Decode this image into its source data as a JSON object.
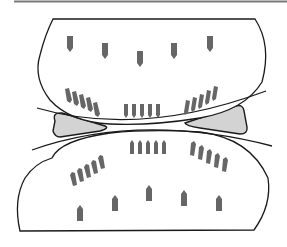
{
  "diagram": {
    "colors": {
      "background": "#ffffff",
      "outline": "#1a1a1a",
      "top_rule": "#7a7a7a",
      "wedge_fill": "#d3d3d3",
      "marker_fill": "#666666"
    },
    "top_body": {
      "outer_markers_count": 5,
      "inner_marker_groups": [
        {
          "position": "left",
          "count": 5
        },
        {
          "position": "center",
          "count": 5
        },
        {
          "position": "right",
          "count": 5
        }
      ],
      "marker_direction": "down"
    },
    "bottom_body": {
      "outer_markers_count": 5,
      "inner_marker_groups": [
        {
          "position": "left",
          "count": 5
        },
        {
          "position": "center",
          "count": 5
        },
        {
          "position": "right",
          "count": 5
        }
      ],
      "marker_direction": "up"
    },
    "wedges": [
      {
        "position": "left"
      },
      {
        "position": "right"
      }
    ]
  }
}
